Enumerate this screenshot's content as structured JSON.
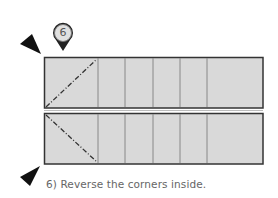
{
  "step": {
    "number": "6",
    "caption": "6) Reverse the corners inside."
  },
  "icons": {
    "step_marker": "map-pin-icon",
    "arrow_top": "triangle-pointer-icon",
    "arrow_bottom": "triangle-pointer-icon"
  },
  "colors": {
    "panel_fill": "#d9d9d9",
    "panel_stroke": "#333333",
    "crease_line": "#777777",
    "fold_line": "#333333",
    "pin_fill": "#222222",
    "pin_inner": "#dddddd",
    "caption_text": "#666666"
  },
  "panels": [
    {
      "name": "top-panel",
      "x": 44,
      "y": 57,
      "width": 219,
      "height": 51
    },
    {
      "name": "bottom-panel",
      "x": 44,
      "y": 113,
      "width": 219,
      "height": 51
    }
  ],
  "crease_lines_x": [
    98,
    125,
    153,
    180,
    207
  ]
}
